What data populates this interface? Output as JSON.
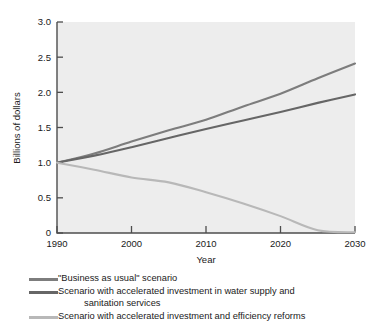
{
  "chart_data": {
    "type": "line",
    "title": "",
    "xlabel": "Year",
    "ylabel": "Billions of dollars",
    "xlim": [
      1990,
      2030
    ],
    "ylim": [
      0,
      3.0
    ],
    "grid": false,
    "legend_position": "below",
    "x_ticks": [
      "1990",
      "2000",
      "2010",
      "2020",
      "2030"
    ],
    "x_tick_values": [
      1990,
      2000,
      2010,
      2020,
      2030
    ],
    "y_ticks": [
      "0",
      "0.5",
      "1.0",
      "1.5",
      "2.0",
      "2.5",
      "3.0"
    ],
    "y_tick_values": [
      0,
      0.5,
      1.0,
      1.5,
      2.0,
      2.5,
      3.0
    ],
    "x": [
      1990,
      1995,
      2000,
      2005,
      2010,
      2015,
      2020,
      2025,
      2030
    ],
    "series": [
      {
        "name": "\"Business as usual\" scenario",
        "color": "#7d7d7d",
        "values": [
          1.0,
          1.13,
          1.3,
          1.46,
          1.61,
          1.8,
          1.98,
          2.2,
          2.41
        ]
      },
      {
        "name": "Scenario with accelerated investment in water supply and sanitation services",
        "color": "#666666",
        "values": [
          1.0,
          1.1,
          1.22,
          1.35,
          1.48,
          1.6,
          1.72,
          1.85,
          1.97
        ]
      },
      {
        "name": "Scenario with accelerated investment and efficiency reforms",
        "color": "#b8b8b8",
        "values": [
          1.0,
          0.9,
          0.79,
          0.72,
          0.58,
          0.42,
          0.24,
          0.04,
          0.01
        ]
      }
    ]
  },
  "legend": [
    {
      "label": "\"Business as usual\" scenario",
      "label_line2": "",
      "color": "#7d7d7d"
    },
    {
      "label": "Scenario with accelerated investment in water supply and",
      "label_line2": "sanitation services",
      "color": "#666666"
    },
    {
      "label": "Scenario with accelerated investment and efficiency reforms",
      "label_line2": "",
      "color": "#b8b8b8"
    }
  ],
  "colors": {
    "plot_background": "#ededed",
    "axis": "#4d4d4d",
    "text": "#1a1a1a",
    "page_background": "#ffffff"
  }
}
